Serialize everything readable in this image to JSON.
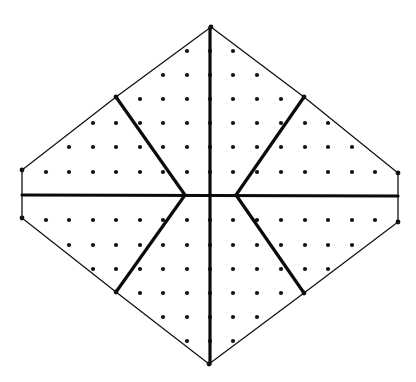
{
  "figure": {
    "colors": {
      "background": "#ffffff",
      "ink": "#111111"
    },
    "outline_vertices": [
      [
        211,
        27
      ],
      [
        304,
        97
      ],
      [
        398,
        173
      ],
      [
        398,
        222
      ],
      [
        304,
        293
      ],
      [
        209,
        364
      ],
      [
        116,
        292
      ],
      [
        22,
        218
      ],
      [
        22,
        170
      ],
      [
        116,
        97
      ]
    ],
    "dividers": [
      {
        "name": "vertical-axis",
        "from": [
          210,
          27
        ],
        "to": [
          210,
          364
        ]
      },
      {
        "name": "horizontal-axis",
        "from": [
          22,
          195
        ],
        "to": [
          398,
          196
        ]
      },
      {
        "name": "spoke-upper-left",
        "from": [
          116,
          97
        ],
        "to": [
          185,
          195
        ]
      },
      {
        "name": "spoke-lower-left",
        "from": [
          185,
          195
        ],
        "to": [
          116,
          292
        ]
      },
      {
        "name": "spoke-upper-right",
        "from": [
          304,
          97
        ],
        "to": [
          236,
          195
        ]
      },
      {
        "name": "spoke-lower-right",
        "from": [
          236,
          195
        ],
        "to": [
          304,
          293
        ]
      }
    ],
    "lattice_rows": [
      {
        "y": 51,
        "xs": [
          187,
          210,
          233
        ]
      },
      {
        "y": 75,
        "xs": [
          163,
          187,
          210,
          233,
          257
        ]
      },
      {
        "y": 99,
        "xs": [
          140,
          163,
          187,
          210,
          233,
          257,
          281
        ]
      },
      {
        "y": 123,
        "xs": [
          93,
          116,
          140,
          163,
          187,
          210,
          233,
          257,
          281,
          305,
          328
        ]
      },
      {
        "y": 147,
        "xs": [
          69,
          93,
          116,
          140,
          163,
          187,
          210,
          233,
          257,
          281,
          305,
          328,
          352
        ]
      },
      {
        "y": 172,
        "xs": [
          46,
          69,
          93,
          116,
          140,
          163,
          187,
          210,
          233,
          257,
          281,
          305,
          328,
          352,
          375
        ]
      },
      {
        "y": 220,
        "xs": [
          46,
          69,
          93,
          116,
          140,
          163,
          187,
          210,
          233,
          257,
          281,
          305,
          328,
          352,
          375
        ]
      },
      {
        "y": 245,
        "xs": [
          69,
          93,
          116,
          140,
          163,
          187,
          210,
          233,
          257,
          281,
          305,
          328,
          352
        ]
      },
      {
        "y": 269,
        "xs": [
          93,
          116,
          140,
          163,
          187,
          210,
          233,
          257,
          281,
          305,
          328
        ]
      },
      {
        "y": 293,
        "xs": [
          140,
          163,
          187,
          210,
          233,
          257,
          281
        ]
      },
      {
        "y": 317,
        "xs": [
          163,
          187,
          210,
          233,
          257
        ]
      },
      {
        "y": 341,
        "xs": [
          187,
          210,
          233
        ]
      }
    ],
    "regions": [
      "upper-left-outer",
      "upper-left-inner",
      "upper-right-inner",
      "upper-right-outer",
      "lower-left-outer",
      "lower-left-inner",
      "lower-right-inner",
      "lower-right-outer"
    ]
  }
}
